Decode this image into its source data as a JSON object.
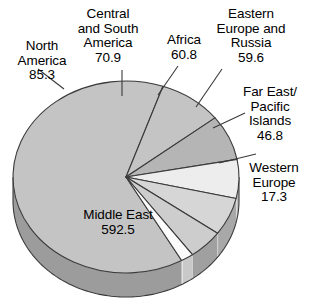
{
  "chart_data": {
    "type": "pie",
    "title": "",
    "subtitle": "",
    "xlabel": "",
    "ylabel": "",
    "legend_position": "labels-with-leader-lines",
    "grid": false,
    "total": 933.2,
    "style": "3d-exploded-none",
    "categories": [
      "Middle East",
      "North America",
      "Central and South America",
      "Africa",
      "Eastern Europe and Russia",
      "Far East/ Pacific Islands",
      "Western Europe"
    ],
    "values": [
      592.5,
      85.3,
      70.9,
      60.8,
      59.6,
      46.8,
      17.3
    ],
    "slices": [
      {
        "name": "Middle East",
        "value": 592.5,
        "value_text": "592.5",
        "label_lines": [
          "Middle East",
          "592.5"
        ],
        "label_placement": "inside",
        "color": "#c4c4c4",
        "side_color": "#9c9c9c",
        "start_angle": 60.5,
        "end_angle": 289.1
      },
      {
        "name": "North America",
        "value": 85.3,
        "value_text": "85.3",
        "label_lines": [
          "North",
          "America",
          "85.3"
        ],
        "label_placement": "outside",
        "color": "#c4c4c4",
        "side_color": "#9c9c9c",
        "start_angle": 289.1,
        "end_angle": 322.0
      },
      {
        "name": "Central and South America",
        "value": 70.9,
        "value_text": "70.9",
        "label_lines": [
          "Central",
          "and South",
          "America",
          "70.9"
        ],
        "label_placement": "outside",
        "color": "#b5b5b5",
        "side_color": "#8e8e8e",
        "start_angle": 322.0,
        "end_angle": 349.4
      },
      {
        "name": "Africa",
        "value": 60.8,
        "value_text": "60.8",
        "label_lines": [
          "Africa",
          "60.8"
        ],
        "label_placement": "outside",
        "color": "#ededed",
        "side_color": "#bcbcbc",
        "start_angle": 349.4,
        "end_angle": 12.9
      },
      {
        "name": "Eastern Europe and Russia",
        "value": 59.6,
        "value_text": "59.6",
        "label_lines": [
          "Eastern",
          "Europe and",
          "Russia",
          "59.6"
        ],
        "label_placement": "outside",
        "color": "#d6d6d6",
        "side_color": "#a8a8a8",
        "start_angle": 12.9,
        "end_angle": 35.9
      },
      {
        "name": "Far East/ Pacific Islands",
        "value": 46.8,
        "value_text": "46.8",
        "label_lines": [
          "Far East/",
          "Pacific",
          "Islands",
          "46.8"
        ],
        "label_placement": "outside",
        "color": "#cdcdcd",
        "side_color": "#a0a0a0",
        "start_angle": 35.9,
        "end_angle": 54.0
      },
      {
        "name": "Western Europe",
        "value": 17.3,
        "value_text": "17.3",
        "label_lines": [
          "Western",
          "Europe",
          "17.3"
        ],
        "label_placement": "outside",
        "color": "#fbfbfb",
        "side_color": "#c9c9c9",
        "start_angle": 54.0,
        "end_angle": 60.5
      }
    ]
  },
  "labels": {
    "north_america": "North\nAmerica\n85.3",
    "central_south_america": "Central\nand South\nAmerica\n70.9",
    "africa": "Africa\n60.8",
    "eastern_europe_russia": "Eastern\nEurope and\nRussia\n59.6",
    "far_east_pacific": "Far East/\nPacific\nIslands\n46.8",
    "western_europe": "Western\nEurope\n17.3",
    "middle_east": "Middle East\n592.5"
  },
  "colors": {
    "outline": "#3a3a3a",
    "leader_line": "#3a3a3a",
    "background": "#ffffff",
    "text": "#000000"
  }
}
